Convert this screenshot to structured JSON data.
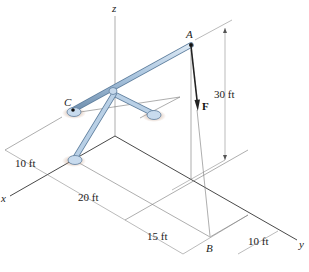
{
  "figure": {
    "axes": {
      "x": "x",
      "y": "y",
      "z": "z"
    },
    "points": {
      "A": "A",
      "B": "B",
      "C": "C"
    },
    "force": {
      "label": "F"
    },
    "dimensions": {
      "height": "30 ft",
      "x_offset": "10 ft",
      "x_span": "20 ft",
      "y_span": "15 ft",
      "y_offset": "10 ft"
    },
    "colors": {
      "member": "#a9c4de",
      "member_edge": "#5f7f9e",
      "support_shadow": "#c9a58f",
      "force_arrow": "#222222"
    }
  }
}
